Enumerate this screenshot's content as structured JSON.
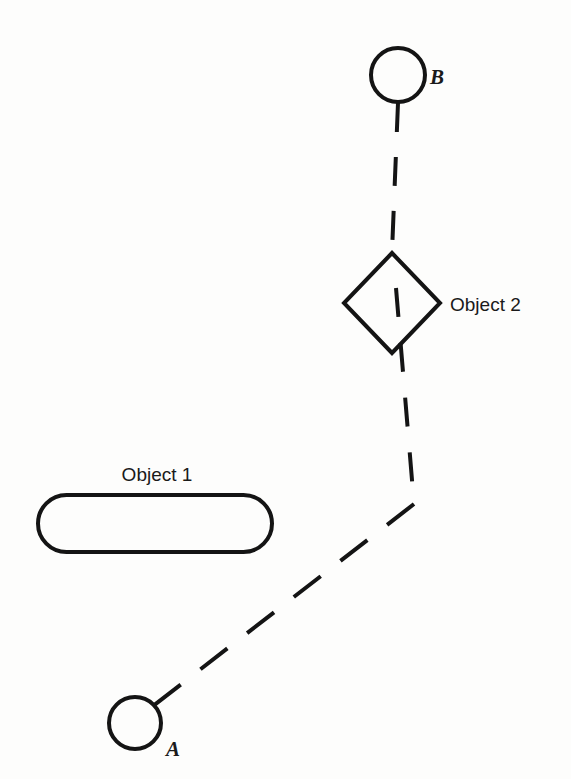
{
  "figure": {
    "title": "",
    "background_color": "#fdfdfc",
    "ink_color": "#141414",
    "width": 571,
    "height": 779
  },
  "nodes": [
    {
      "id": "B",
      "label": "B",
      "shape": "circle",
      "cx": 398,
      "cy": 75,
      "r": 27,
      "stroke_width": 4,
      "label_x": 430,
      "label_y": 84
    },
    {
      "id": "A",
      "label": "A",
      "shape": "circle",
      "cx": 135,
      "cy": 723,
      "r": 26,
      "stroke_width": 4,
      "label_x": 166,
      "label_y": 756
    }
  ],
  "objects": [
    {
      "id": "object1",
      "label": "Object 1",
      "shape": "stadium",
      "x": 38,
      "y": 495,
      "width": 234,
      "height": 57,
      "rx": 28.5,
      "stroke_width": 4,
      "label_x": 157,
      "label_y": 481,
      "label_anchor": "middle"
    },
    {
      "id": "object2",
      "label": "Object 2",
      "shape": "diamond",
      "cx": 392,
      "cy": 303,
      "half_width": 48,
      "half_height": 50,
      "points": "392,253 440,303 392,353 344,303",
      "stroke_width": 4,
      "label_x": 450,
      "label_y": 311,
      "label_anchor": "start"
    }
  ],
  "links": [
    {
      "id": "b-to-object2",
      "from": "B",
      "to": "object2",
      "style": "dashed",
      "stroke_width": 4,
      "dash_pattern": "29 25",
      "path": "M 398 103 L 392 252"
    },
    {
      "id": "object2-to-bend",
      "from": "object2",
      "to": "bend",
      "style": "dashed",
      "stroke_width": 4,
      "dash_pattern": "29 25",
      "path": "M 394 290 L 414 504"
    },
    {
      "id": "bend-to-a",
      "from": "bend",
      "to": "A",
      "style": "dashed",
      "stroke_width": 4,
      "dash_pattern": "34 25",
      "path": "M 414 504 L 153 706"
    }
  ],
  "bend_point": {
    "id": "path-bend",
    "x": 414,
    "y": 504
  }
}
